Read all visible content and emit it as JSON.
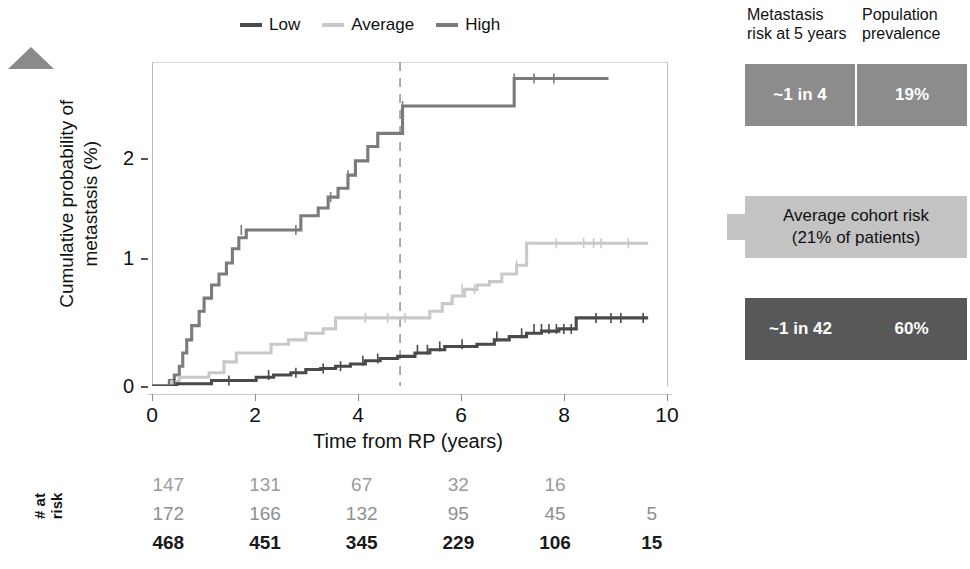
{
  "legend": {
    "items": [
      {
        "label": "Low",
        "color": "#4a4a4a"
      },
      {
        "label": "Average",
        "color": "#c9c9c9"
      },
      {
        "label": "High",
        "color": "#7b7b7b"
      }
    ]
  },
  "axes": {
    "x_title": "Time from RP (years)",
    "y_title_line1": "Cumulative probability of",
    "y_title_line2": "metastasis (%)",
    "x_ticks": [
      "0",
      "2",
      "4",
      "6",
      "8",
      "10"
    ],
    "y_ticks": [
      "0",
      "1",
      "2"
    ]
  },
  "callout_headers": {
    "left": "Metastasis",
    "left2": "risk at 5 years",
    "right": "Population",
    "right2": "prevalence"
  },
  "callouts": {
    "high": {
      "risk": "~1 in 4",
      "prevalence": "19%",
      "color": "#8c8c8c"
    },
    "average": {
      "line1": "Average cohort risk",
      "line2": "(21% of patients)",
      "color": "#c3c3c3"
    },
    "low": {
      "risk": "~1 in 42",
      "prevalence": "60%",
      "color": "#585858"
    }
  },
  "at_risk": {
    "label": "# at risk",
    "rows": [
      {
        "group": "High",
        "values": [
          "147",
          "131",
          "67",
          "32",
          "16",
          ""
        ]
      },
      {
        "group": "Average",
        "values": [
          "172",
          "166",
          "132",
          "95",
          "45",
          "5"
        ]
      },
      {
        "group": "Low",
        "values": [
          "468",
          "451",
          "345",
          "229",
          "106",
          "15"
        ]
      }
    ]
  },
  "chart_data": {
    "type": "line",
    "title": "",
    "xlabel": "Time from RP (years)",
    "ylabel": "Cumulative probability of metastasis (%)",
    "xlim": [
      0,
      10.4
    ],
    "ylim": [
      0,
      2.95
    ],
    "grid": false,
    "legend_position": "top",
    "reference_line": {
      "x": 5,
      "style": "dashed",
      "color": "#9a9a9a"
    },
    "series": [
      {
        "name": "High",
        "color": "#7b7b7b",
        "step": "post",
        "x": [
          0.0,
          0.35,
          0.45,
          0.55,
          0.62,
          0.7,
          0.8,
          0.95,
          1.05,
          1.2,
          1.35,
          1.5,
          1.62,
          1.75,
          1.9,
          2.05,
          2.25,
          2.6,
          3.0,
          3.35,
          3.55,
          3.75,
          3.95,
          4.1,
          4.35,
          4.55,
          4.75,
          5.05,
          7.3,
          9.2
        ],
        "y": [
          0.0,
          0.05,
          0.1,
          0.18,
          0.3,
          0.42,
          0.55,
          0.68,
          0.8,
          0.92,
          1.02,
          1.12,
          1.25,
          1.35,
          1.42,
          1.42,
          1.42,
          1.42,
          1.55,
          1.62,
          1.72,
          1.8,
          1.92,
          2.05,
          2.18,
          2.3,
          2.3,
          2.55,
          2.8,
          2.8
        ],
        "censor_x": [
          1.8,
          2.9,
          3.6,
          3.95,
          5.05,
          7.3,
          7.7,
          8.1
        ],
        "censor_y": [
          1.42,
          1.42,
          1.72,
          1.92,
          2.55,
          2.8,
          2.8,
          2.8
        ]
      },
      {
        "name": "Average",
        "color": "#c9c9c9",
        "step": "post",
        "x": [
          0.0,
          0.4,
          0.55,
          0.75,
          1.15,
          1.45,
          1.7,
          2.0,
          2.4,
          2.75,
          3.1,
          3.45,
          3.7,
          4.0,
          4.35,
          5.6,
          5.85,
          6.05,
          6.3,
          6.55,
          6.8,
          7.05,
          7.35,
          7.55,
          10.0
        ],
        "y": [
          0.0,
          0.04,
          0.08,
          0.08,
          0.12,
          0.22,
          0.3,
          0.3,
          0.38,
          0.42,
          0.48,
          0.52,
          0.62,
          0.62,
          0.62,
          0.68,
          0.75,
          0.82,
          0.88,
          0.92,
          0.95,
          1.02,
          1.1,
          1.3,
          1.3
        ],
        "censor_x": [
          4.3,
          4.75,
          5.1,
          6.25,
          6.5,
          7.35,
          8.15,
          8.7,
          8.9,
          9.05,
          9.6
        ],
        "censor_y": [
          0.62,
          0.62,
          0.62,
          0.88,
          0.88,
          1.1,
          1.3,
          1.3,
          1.3,
          1.3,
          1.3
        ]
      },
      {
        "name": "Low",
        "color": "#4a4a4a",
        "step": "post",
        "x": [
          0.0,
          0.5,
          1.2,
          1.7,
          2.1,
          2.45,
          2.8,
          3.1,
          3.4,
          3.7,
          4.0,
          4.3,
          4.6,
          4.95,
          5.3,
          5.6,
          5.9,
          6.2,
          6.55,
          6.9,
          7.2,
          7.55,
          7.85,
          8.2,
          8.55,
          10.0
        ],
        "y": [
          0.0,
          0.02,
          0.05,
          0.05,
          0.08,
          0.1,
          0.12,
          0.15,
          0.16,
          0.18,
          0.2,
          0.23,
          0.25,
          0.27,
          0.3,
          0.33,
          0.36,
          0.36,
          0.38,
          0.42,
          0.45,
          0.48,
          0.5,
          0.52,
          0.62,
          0.62
        ],
        "censor_x": [
          0.45,
          1.55,
          2.35,
          2.9,
          3.45,
          3.8,
          4.25,
          4.55,
          5.35,
          5.55,
          5.8,
          6.25,
          6.95,
          7.45,
          7.7,
          7.85,
          8.0,
          8.15,
          8.3,
          8.45,
          8.95,
          9.25,
          9.45,
          9.9
        ],
        "censor_y": [
          0.02,
          0.05,
          0.1,
          0.12,
          0.16,
          0.18,
          0.23,
          0.25,
          0.33,
          0.33,
          0.36,
          0.38,
          0.45,
          0.48,
          0.52,
          0.52,
          0.52,
          0.52,
          0.52,
          0.52,
          0.62,
          0.62,
          0.62,
          0.62
        ]
      }
    ]
  }
}
